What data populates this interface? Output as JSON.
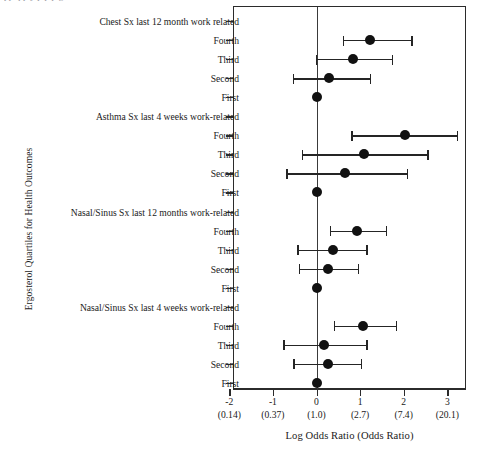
{
  "caption_remnant": "pp     q      p     y p p                     p                 g",
  "axes": {
    "y_title": "Ergosterol Quartiles for Health Outcomes",
    "x_title": "Log Odds Ratio (Odds Ratio)",
    "x_ticks": [
      {
        "value": -2,
        "label": "-2",
        "sub": "(0.14)"
      },
      {
        "value": -1,
        "label": "-1",
        "sub": "(0.37)"
      },
      {
        "value": 0,
        "label": "0",
        "sub": "(1.0)"
      },
      {
        "value": 1,
        "label": "1",
        "sub": "(2.7)"
      },
      {
        "value": 2,
        "label": "2",
        "sub": "(7.4)"
      },
      {
        "value": 3,
        "label": "3",
        "sub": "(20.1)"
      }
    ],
    "reference_line": 0
  },
  "chart_data": {
    "type": "scatter",
    "title": "",
    "xlabel": "Log Odds Ratio (Odds Ratio)",
    "ylabel": "Ergosterol Quartiles for Health Outcomes",
    "xlim": [
      -2,
      3
    ],
    "grid": false,
    "legend": "none",
    "reference_line_x": 0,
    "secondary_xlabels": [
      "(0.14)",
      "(0.37)",
      "(1.0)",
      "(2.7)",
      "(7.4)",
      "(20.1)"
    ],
    "rows": [
      {
        "label": "Chest Sx last 12 month work related",
        "type": "group"
      },
      {
        "label": "Fourth",
        "type": "estimate",
        "estimate": 1.22,
        "ci_low": 0.61,
        "ci_high": 2.21
      },
      {
        "label": "Third",
        "type": "estimate",
        "estimate": 0.84,
        "ci_low": -0.01,
        "ci_high": 1.76
      },
      {
        "label": "Second",
        "type": "estimate",
        "estimate": 0.29,
        "ci_low": -0.55,
        "ci_high": 1.26
      },
      {
        "label": "First",
        "type": "estimate",
        "estimate": 0.0,
        "ci_low": 0.0,
        "ci_high": 0.0
      },
      {
        "label": "Asthma Sx last 4 weeks work-related",
        "type": "group"
      },
      {
        "label": "Fourth",
        "type": "estimate",
        "estimate": 2.02,
        "ci_low": 0.8,
        "ci_high": 3.25
      },
      {
        "label": "Third",
        "type": "estimate",
        "estimate": 1.1,
        "ci_low": -0.34,
        "ci_high": 2.57
      },
      {
        "label": "Second",
        "type": "estimate",
        "estimate": 0.66,
        "ci_low": -0.69,
        "ci_high": 2.11
      },
      {
        "label": "First",
        "type": "estimate",
        "estimate": 0.0,
        "ci_low": 0.0,
        "ci_high": 0.0
      },
      {
        "label": "Nasal/Sinus Sx last 12 months work-related",
        "type": "group"
      },
      {
        "label": "Fourth",
        "type": "estimate",
        "estimate": 0.93,
        "ci_low": 0.3,
        "ci_high": 1.62
      },
      {
        "label": "Third",
        "type": "estimate",
        "estimate": 0.37,
        "ci_low": -0.44,
        "ci_high": 1.17
      },
      {
        "label": "Second",
        "type": "estimate",
        "estimate": 0.27,
        "ci_low": -0.41,
        "ci_high": 0.98
      },
      {
        "label": "First",
        "type": "estimate",
        "estimate": 0.0,
        "ci_low": 0.0,
        "ci_high": 0.0
      },
      {
        "label": "Nasal/Sinus Sx last 4 weeks work-related",
        "type": "group"
      },
      {
        "label": "Fourth",
        "type": "estimate",
        "estimate": 1.07,
        "ci_low": 0.39,
        "ci_high": 1.85
      },
      {
        "label": "Third",
        "type": "estimate",
        "estimate": 0.18,
        "ci_low": -0.76,
        "ci_high": 1.17
      },
      {
        "label": "Second",
        "type": "estimate",
        "estimate": 0.27,
        "ci_low": -0.53,
        "ci_high": 1.05
      },
      {
        "label": "First",
        "type": "estimate",
        "estimate": 0.0,
        "ci_low": 0.0,
        "ci_high": 0.0
      }
    ]
  },
  "colors": {
    "point": "#111111",
    "line": "#252525",
    "frame": "#2b2b2b",
    "text": "#1a1a1a"
  }
}
